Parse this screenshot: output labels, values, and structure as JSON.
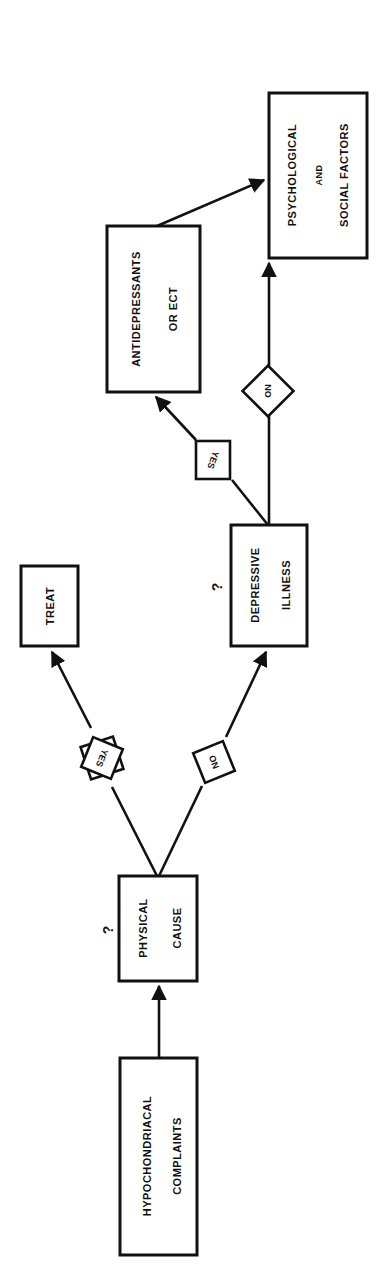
{
  "diagram": {
    "orientation": "rotated -90deg (reads bottom-to-top)",
    "nodes": {
      "hypochondriacal": {
        "line1": "HYPOCHONDRIACAL",
        "line2": "COMPLAINTS"
      },
      "physical_cause": {
        "line1": "PHYSICAL",
        "line2": "CAUSE",
        "question": "?"
      },
      "treat": {
        "line1": "TREAT"
      },
      "depressive_illness": {
        "line1": "DEPRESSIVE",
        "line2": "ILLNESS",
        "question": "?"
      },
      "antidepressants": {
        "line1": "ANTIDEPRESSANTS",
        "line2": "OR ECT"
      },
      "psych_social": {
        "line1": "PSYCHOLOGICAL",
        "line2": "AND",
        "line3": "SOCIAL FACTORS"
      }
    },
    "decisions": {
      "physical_yes": "YES",
      "physical_no": "NO",
      "depressive_yes": "YES",
      "depressive_no": "NO"
    },
    "edges": [
      {
        "from": "hypochondriacal",
        "to": "physical_cause"
      },
      {
        "from": "physical_cause",
        "to": "treat",
        "label": "YES"
      },
      {
        "from": "physical_cause",
        "to": "depressive_illness",
        "label": "NO"
      },
      {
        "from": "depressive_illness",
        "to": "antidepressants",
        "label": "YES"
      },
      {
        "from": "depressive_illness",
        "to": "psych_social",
        "label": "NO"
      },
      {
        "from": "antidepressants",
        "to": "psych_social"
      }
    ]
  }
}
